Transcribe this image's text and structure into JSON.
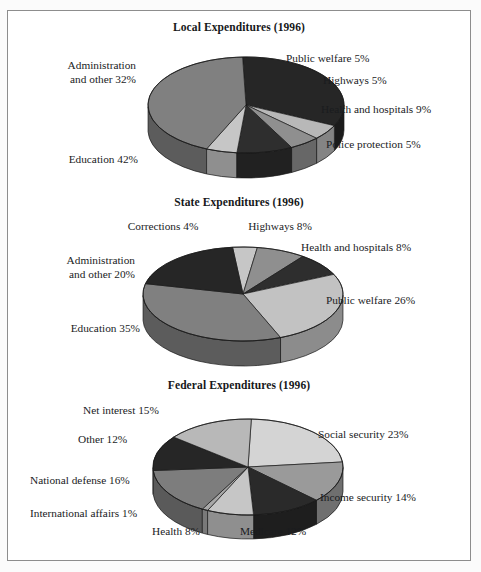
{
  "document": {
    "background_color": "#ffffff",
    "border_color": "#8d8d8d"
  },
  "palette": {
    "very_dark": "#262626",
    "dark": "#333333",
    "mid_dark": "#5e5e5e",
    "mid": "#808080",
    "mid_light": "#9a9a9a",
    "light": "#b8b8b8",
    "very_light": "#d4d4d4",
    "edge": "#1a1a1a"
  },
  "charts": [
    {
      "id": "local-expenditures",
      "title": "Local Expenditures (1996)",
      "chart_data": {
        "type": "pie",
        "title": "Local Expenditures (1996)",
        "unit": "percent",
        "total": 98,
        "labels": [
          "Administration and other 32%",
          "Public welfare 5%",
          "Highways 5%",
          "Health and hospitals 9%",
          "Police protection 5%",
          "Education 42%"
        ],
        "categories": [
          "Administration and other",
          "Public welfare",
          "Highways",
          "Health and hospitals",
          "Police protection",
          "Education"
        ],
        "values": [
          32,
          5,
          5,
          9,
          5,
          42
        ],
        "colors": [
          "#262626",
          "#b8b8b8",
          "#8f8f8f",
          "#2e2e2e",
          "#c6c6c6",
          "#808080"
        ],
        "legend": "none",
        "grid": false
      },
      "labels": [
        {
          "text": "Administration\nand other 32%",
          "align": "left"
        },
        {
          "text": "Public welfare 5%",
          "align": "right"
        },
        {
          "text": "Highways 5%",
          "align": "right"
        },
        {
          "text": "Health and hospitals 9%",
          "align": "right"
        },
        {
          "text": "Police protection 5%",
          "align": "right"
        },
        {
          "text": "Education 42%",
          "align": "right"
        }
      ]
    },
    {
      "id": "state-expenditures",
      "title": "State Expenditures (1996)",
      "chart_data": {
        "type": "pie",
        "title": "State Expenditures (1996)",
        "unit": "percent",
        "total": 101,
        "labels": [
          "Corrections 4%",
          "Highways 8%",
          "Health and hospitals 8%",
          "Public welfare 26%",
          "Education 35%",
          "Administration and other 20%"
        ],
        "categories": [
          "Corrections",
          "Highways",
          "Health and hospitals",
          "Public welfare",
          "Education",
          "Administration and other"
        ],
        "values": [
          4,
          8,
          8,
          26,
          35,
          20
        ],
        "colors": [
          "#c6c6c6",
          "#8f8f8f",
          "#2e2e2e",
          "#c2c2c2",
          "#808080",
          "#262626"
        ],
        "legend": "none",
        "grid": false
      },
      "labels": [
        {
          "text": "Corrections 4%",
          "align": "center"
        },
        {
          "text": "Highways 8%",
          "align": "center"
        },
        {
          "text": "Health and hospitals 8%",
          "align": "right"
        },
        {
          "text": "Public welfare 26%",
          "align": "right"
        },
        {
          "text": "Education 35%",
          "align": "right"
        },
        {
          "text": "Administration\nand other 20%",
          "align": "left"
        }
      ]
    },
    {
      "id": "federal-expenditures",
      "title": "Federal Expenditures (1996)",
      "chart_data": {
        "type": "pie",
        "title": "Federal Expenditures (1996)",
        "unit": "percent",
        "total": 101,
        "labels": [
          "Social security 23%",
          "Income security 14%",
          "Medicare 12%",
          "Health 8%",
          "International affairs 1%",
          "National defense 16%",
          "Other 12%",
          "Net interest 15%"
        ],
        "categories": [
          "Social security",
          "Income security",
          "Medicare",
          "Health",
          "International affairs",
          "National defense",
          "Other",
          "Net interest"
        ],
        "values": [
          23,
          14,
          12,
          8,
          1,
          16,
          12,
          15
        ],
        "colors": [
          "#d4d4d4",
          "#9a9a9a",
          "#2a2a2a",
          "#c6c6c6",
          "#a8a8a8",
          "#7d7d7d",
          "#262626",
          "#b8b8b8"
        ],
        "legend": "none",
        "grid": false
      },
      "labels": [
        {
          "text": "Net interest 15%",
          "align": "right"
        },
        {
          "text": "Social security 23%",
          "align": "right"
        },
        {
          "text": "Other 12%",
          "align": "right"
        },
        {
          "text": "National defense 16%",
          "align": "right"
        },
        {
          "text": "Income security 14%",
          "align": "right"
        },
        {
          "text": "International affairs 1%",
          "align": "right"
        },
        {
          "text": "Health 8%",
          "align": "center"
        },
        {
          "text": "Medicare 12%",
          "align": "center"
        }
      ]
    }
  ]
}
